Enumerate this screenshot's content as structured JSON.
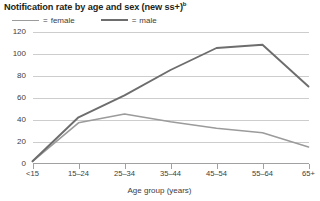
{
  "chart_data": {
    "type": "line",
    "title": "Notification rate by age and sex (new ss+)",
    "title_superscript": "b",
    "subtitle": "",
    "xlabel": "Age group (years)",
    "ylabel": "",
    "categories": [
      "<15",
      "15–24",
      "25–34",
      "35–44",
      "45–54",
      "55–64",
      "65+"
    ],
    "series": [
      {
        "name": "female",
        "color": "#9b9b9b",
        "values": [
          2,
          37,
          45,
          38,
          32,
          28,
          15
        ]
      },
      {
        "name": "male",
        "color": "#6d6d6d",
        "values": [
          2,
          42,
          62,
          85,
          105,
          108,
          70
        ]
      }
    ],
    "yticks": [
      0,
      20,
      40,
      60,
      80,
      100,
      120
    ],
    "ylim": [
      0,
      120
    ],
    "grid": true,
    "legend_position": "top-left",
    "legend_separator": "="
  },
  "legend": {
    "female_label": "female",
    "male_label": "male",
    "equals": "="
  },
  "axis": {
    "y_tick_labels": [
      "120",
      "100",
      "80",
      "60",
      "40",
      "20",
      "0"
    ],
    "x_tick_labels": [
      "<15",
      "15–24",
      "25–34",
      "35–44",
      "45–54",
      "55–64",
      "65+"
    ],
    "x_axis_title": "Age group (years)"
  },
  "colors": {
    "female_line": "#9b9b9b",
    "male_line": "#6d6d6d",
    "gridline": "#b8b8b8",
    "axis": "#8a8a8a",
    "text": "#404040",
    "title": "#231f20",
    "background": "#ffffff"
  }
}
